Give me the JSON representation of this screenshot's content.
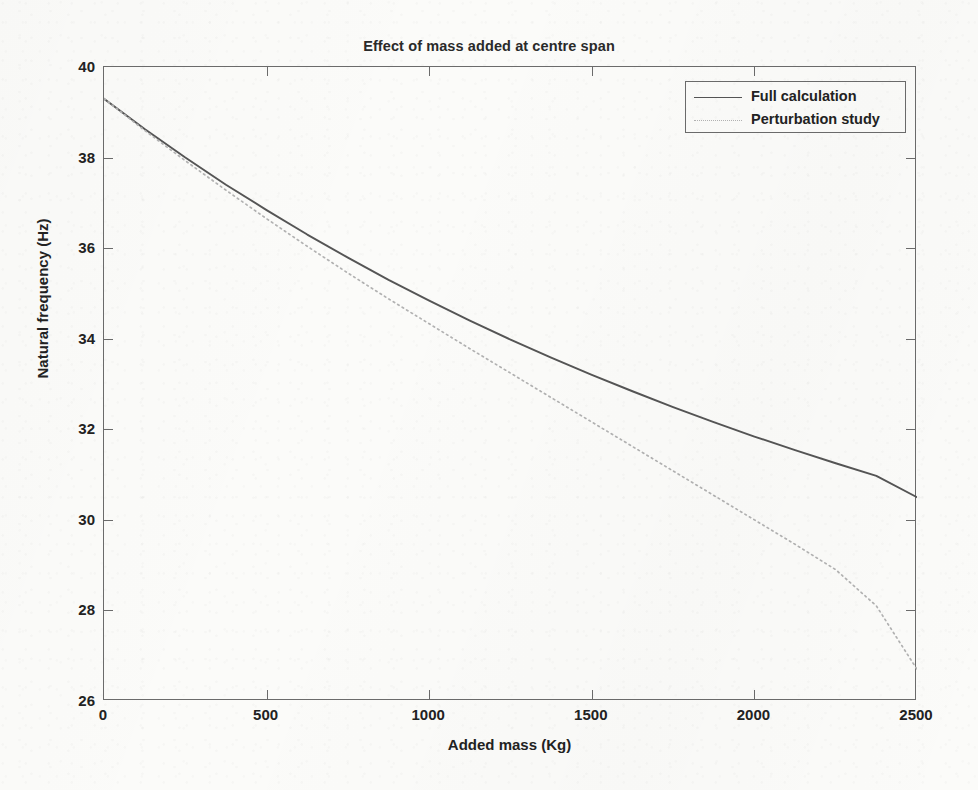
{
  "chart_data": {
    "type": "line",
    "title": "Effect of mass added at centre span",
    "xlabel": "Added mass (Kg)",
    "ylabel": "Natural frequency (Hz)",
    "xlim": [
      0,
      2500
    ],
    "ylim": [
      26,
      40
    ],
    "xticks": [
      0,
      500,
      1000,
      1500,
      2000,
      2500
    ],
    "yticks": [
      26,
      28,
      30,
      32,
      34,
      36,
      38,
      40
    ],
    "xtick_labels": [
      "0",
      "500",
      "1000",
      "1500",
      "2000",
      "2500"
    ],
    "ytick_labels": [
      "26",
      "28",
      "30",
      "32",
      "34",
      "36",
      "38",
      "40"
    ],
    "grid": false,
    "legend_position": "top-right",
    "x": [
      0,
      125,
      250,
      375,
      500,
      625,
      750,
      875,
      1000,
      1125,
      1250,
      1375,
      1500,
      1625,
      1750,
      1875,
      2000,
      2125,
      2250,
      2375,
      2500
    ],
    "series": [
      {
        "name": "Full calculation",
        "style": "solid",
        "color": "#555555",
        "values": [
          39.3,
          38.63,
          38.0,
          37.4,
          36.84,
          36.3,
          35.79,
          35.3,
          34.84,
          34.4,
          33.98,
          33.58,
          33.2,
          32.84,
          32.49,
          32.16,
          31.84,
          31.54,
          31.25,
          30.97,
          30.5
        ]
      },
      {
        "name": "Perturbation study",
        "style": "dotted",
        "color": "#b2b2b2",
        "values": [
          39.3,
          38.6,
          37.93,
          37.28,
          36.65,
          36.04,
          35.45,
          34.88,
          34.33,
          33.78,
          33.24,
          32.7,
          32.16,
          31.62,
          31.08,
          30.54,
          30.0,
          29.46,
          28.9,
          28.1,
          26.7
        ]
      }
    ]
  },
  "legend": {
    "entries": [
      {
        "label": "Full calculation",
        "sample": "solid-line-sample"
      },
      {
        "label": "Perturbation study",
        "sample": "dotted-line-sample"
      }
    ]
  }
}
